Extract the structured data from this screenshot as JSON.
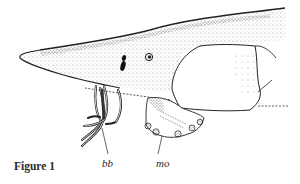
{
  "figure": {
    "caption": "Figure 1",
    "labels": [
      {
        "id": "bb",
        "text": "bb"
      },
      {
        "id": "mo",
        "text": "mo"
      }
    ],
    "colors": {
      "ink": "#2a2a2a",
      "background": "#ffffff"
    }
  }
}
